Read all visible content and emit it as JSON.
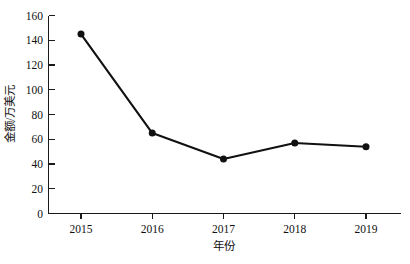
{
  "chart_data": {
    "type": "line",
    "title": "",
    "xlabel": "年份",
    "ylabel": "金额/万美元",
    "categories": [
      "2015",
      "2016",
      "2017",
      "2018",
      "2019"
    ],
    "x": [
      2015,
      2016,
      2017,
      2018,
      2019
    ],
    "values": [
      145,
      65,
      44,
      57,
      54
    ],
    "series": [
      {
        "name": "金额/万美元",
        "values": [
          145,
          65,
          44,
          57,
          54
        ]
      }
    ],
    "ylim": [
      0,
      160
    ],
    "xlim": [
      2014.5,
      2019.5
    ],
    "yticks": [
      0,
      20,
      40,
      60,
      80,
      100,
      120,
      140,
      160
    ],
    "ytick_labels": [
      "0",
      "20",
      "40",
      "60",
      "80",
      "100",
      "120",
      "140",
      "160"
    ],
    "xticks": [
      2015,
      2016,
      2017,
      2018,
      2019
    ],
    "xtick_labels": [
      "2015",
      "2016",
      "2017",
      "2018",
      "2019"
    ],
    "grid": false,
    "legend": false,
    "legend_position": "none",
    "marker": "circle",
    "line_color": "#111111",
    "marker_color": "#111111",
    "background_color": "#ffffff"
  }
}
